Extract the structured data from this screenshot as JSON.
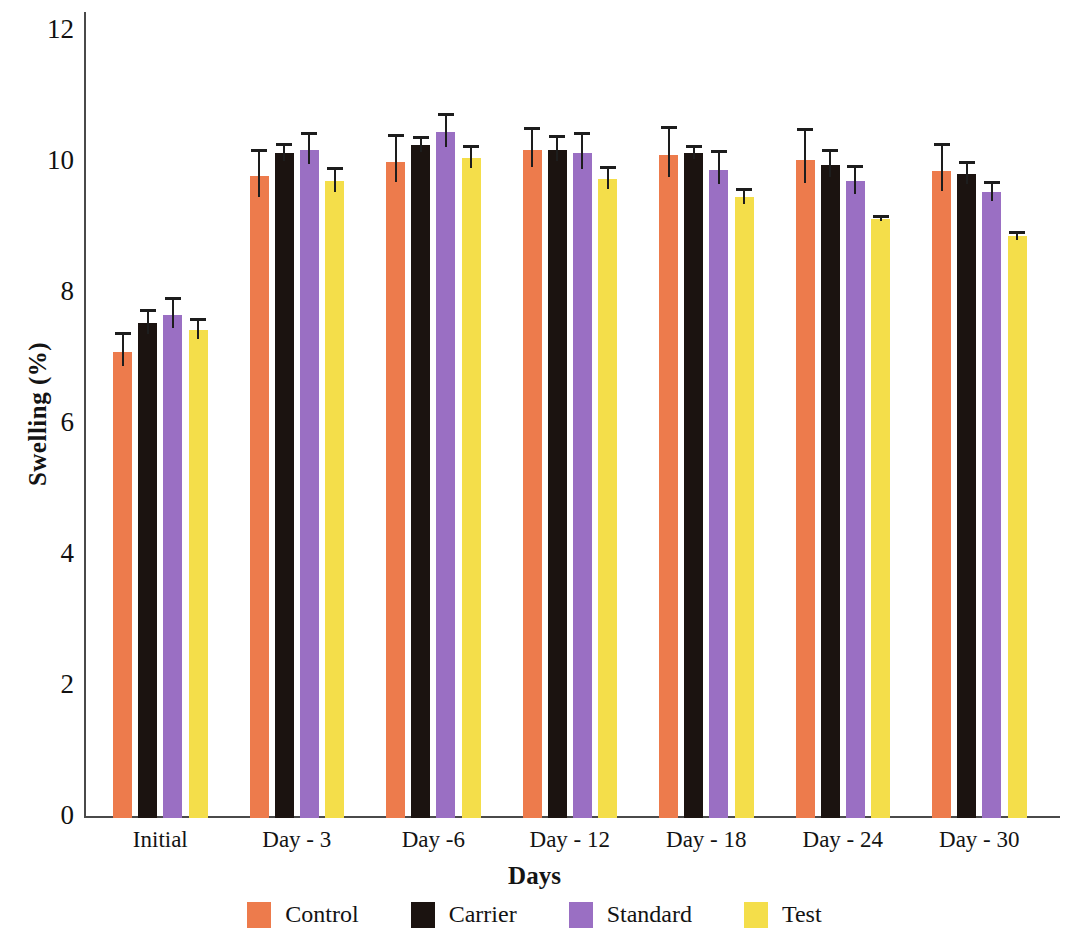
{
  "chart_data": {
    "type": "bar",
    "title": "",
    "xlabel": "Days",
    "ylabel": "Swelling (%)",
    "categories": [
      "Initial",
      "Day - 3",
      "Day -6",
      "Day - 12",
      "Day - 18",
      "Day - 24",
      "Day - 30"
    ],
    "ylim": [
      0,
      12
    ],
    "yticks": [
      0,
      2,
      4,
      6,
      8,
      10,
      12
    ],
    "ytick_labels": [
      "0",
      "2",
      "4",
      "6",
      "8",
      "10",
      "12"
    ],
    "grid": false,
    "legend_position": "bottom",
    "series": [
      {
        "name": "Control",
        "color": "#ed7b4c",
        "values": [
          7.12,
          9.8,
          10.02,
          10.2,
          10.12,
          10.05,
          9.88
        ],
        "errors": [
          0.3,
          0.42,
          0.42,
          0.35,
          0.45,
          0.48,
          0.42
        ]
      },
      {
        "name": "Carrier",
        "color": "#1b1310",
        "values": [
          7.55,
          10.15,
          10.27,
          10.2,
          10.15,
          9.97,
          9.83
        ],
        "errors": [
          0.22,
          0.16,
          0.14,
          0.22,
          0.12,
          0.25,
          0.2
        ]
      },
      {
        "name": "Standard",
        "color": "#9a6fc3",
        "values": [
          7.68,
          10.2,
          10.47,
          10.15,
          9.9,
          9.72,
          9.55
        ],
        "errors": [
          0.27,
          0.28,
          0.3,
          0.33,
          0.3,
          0.25,
          0.18
        ]
      },
      {
        "name": "Test",
        "color": "#f4de4a",
        "values": [
          7.45,
          9.72,
          10.08,
          9.75,
          9.48,
          9.15,
          8.88
        ],
        "errors": [
          0.18,
          0.22,
          0.2,
          0.2,
          0.14,
          0.05,
          0.08
        ]
      }
    ]
  },
  "axis": {
    "y_title": "Swelling (%)",
    "x_title": "Days"
  },
  "legend": {
    "items": [
      {
        "label": "Control",
        "color": "#ed7b4c"
      },
      {
        "label": "Carrier",
        "color": "#1b1310"
      },
      {
        "label": "Standard",
        "color": "#9a6fc3"
      },
      {
        "label": "Test",
        "color": "#f4de4a"
      }
    ]
  }
}
